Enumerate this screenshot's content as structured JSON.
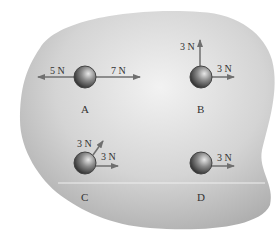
{
  "diagram": {
    "background_color": "#c8c8c8",
    "arrow_color": "#7a7a7a",
    "objects": [
      {
        "id": "A",
        "label": "A",
        "forces": [
          {
            "label": "5 N",
            "direction": "left"
          },
          {
            "label": "7 N",
            "direction": "right"
          }
        ]
      },
      {
        "id": "B",
        "label": "B",
        "forces": [
          {
            "label": "3 N",
            "direction": "up"
          },
          {
            "label": "3 N",
            "direction": "right"
          }
        ]
      },
      {
        "id": "C",
        "label": "C",
        "forces": [
          {
            "label": "3 N",
            "direction": "up-right"
          },
          {
            "label": "3 N",
            "direction": "right"
          }
        ]
      },
      {
        "id": "D",
        "label": "D",
        "forces": [
          {
            "label": "3 N",
            "direction": "right"
          }
        ]
      }
    ]
  }
}
